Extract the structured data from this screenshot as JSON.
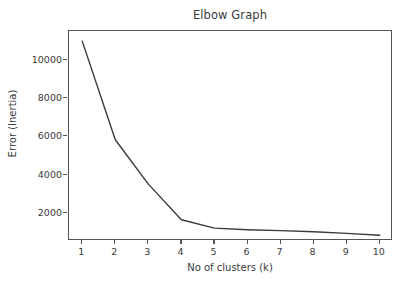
{
  "chart_data": {
    "type": "line",
    "title": "Elbow Graph",
    "xlabel": "No of clusters (k)",
    "ylabel": "Error (Inertia)",
    "x": [
      1,
      2,
      3,
      4,
      5,
      6,
      7,
      8,
      9,
      10
    ],
    "values": [
      10970,
      5820,
      3500,
      1640,
      1200,
      1120,
      1070,
      1010,
      930,
      830
    ],
    "series": [
      {
        "name": "inertia",
        "values": [
          10970,
          5820,
          3500,
          1640,
          1200,
          1120,
          1070,
          1010,
          930,
          830
        ]
      }
    ],
    "xlim": [
      0.6,
      10.4
    ],
    "ylim": [
      530,
      11500
    ],
    "xticks": [
      1,
      2,
      3,
      4,
      5,
      6,
      7,
      8,
      9,
      10
    ],
    "xtick_labels": [
      "1",
      "2",
      "3",
      "4",
      "5",
      "6",
      "7",
      "8",
      "9",
      "10"
    ],
    "yticks": [
      2000,
      4000,
      6000,
      8000,
      10000
    ],
    "ytick_labels": [
      "2000",
      "4000",
      "6000",
      "8000",
      "10000"
    ],
    "grid": false,
    "legend": false,
    "legend_position": "none",
    "line_color": "#3a3a3a",
    "line_width": 1.4,
    "background_color": "#ffffff",
    "axis_color": "#555555",
    "text_color": "#3b3b3b"
  }
}
